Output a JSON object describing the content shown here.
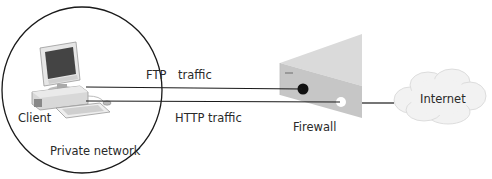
{
  "diagram": {
    "type": "network-diagram",
    "nodes": {
      "client": {
        "label": "Client"
      },
      "private_network": {
        "label": "Private network"
      },
      "firewall": {
        "label": "Firewall"
      },
      "internet": {
        "label": "Internet"
      }
    },
    "connections": [
      {
        "label": "FTP traffic",
        "from": "client",
        "to": "firewall",
        "port_state": "blocked"
      },
      {
        "label": "HTTP traffic",
        "from": "client",
        "to": "firewall",
        "port_state": "open"
      },
      {
        "label": "",
        "from": "firewall",
        "to": "internet"
      }
    ],
    "colors": {
      "line": "#1a1a1a",
      "firewall_top": "#d9d9d9",
      "firewall_front": "#c4c4c4",
      "cloud": "#f0f0f0",
      "blocked_port": "#111111",
      "open_port": "#ffffff"
    }
  }
}
